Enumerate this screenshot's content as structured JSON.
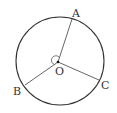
{
  "diagram": {
    "type": "circle-geometry",
    "center": {
      "label": "O",
      "x": 58,
      "y": 62
    },
    "radius": 44,
    "points": [
      {
        "label": "A",
        "x": 72,
        "y": 20,
        "label_x": 72,
        "label_y": 18
      },
      {
        "label": "B",
        "x": 26,
        "y": 85,
        "label_x": 13,
        "label_y": 95
      },
      {
        "label": "C",
        "x": 98,
        "y": 80,
        "label_x": 101,
        "label_y": 89
      }
    ],
    "angle_mark": "reflex angle arc at O between OA and OB",
    "colors": {
      "circle": "#333333",
      "radii": "#555555",
      "text": "#333333"
    }
  }
}
